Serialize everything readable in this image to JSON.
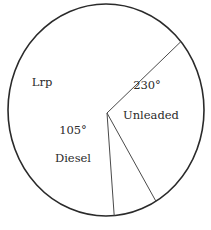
{
  "chart_data": {
    "type": "pie",
    "title": "",
    "unit": "degrees",
    "slices": [
      {
        "name": "Unleaded",
        "value": 230,
        "value_label": "230°",
        "show_value": true
      },
      {
        "name": "Diesel",
        "value": 105,
        "value_label": "105°",
        "show_value": true
      },
      {
        "name": "Lrp",
        "value": 25,
        "value_label": "",
        "show_value": false
      }
    ],
    "total": 360,
    "legend": "none",
    "colors": {
      "fill": "#ffffff",
      "stroke": "#2a2a2a",
      "text": "#2a2a2a"
    }
  }
}
